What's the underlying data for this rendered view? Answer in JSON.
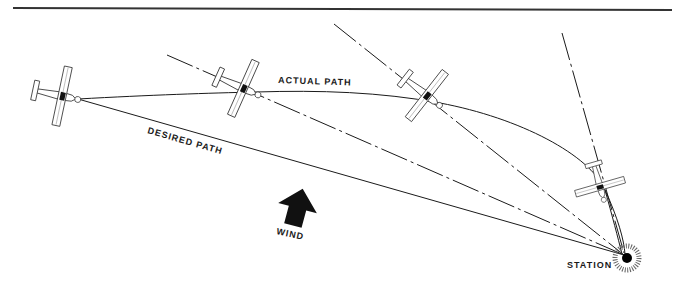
{
  "diagram": {
    "type": "wind-drift navigation diagram",
    "labels": {
      "actual_path": "ACTUAL PATH",
      "desired_path": "DESIRED PATH",
      "wind": "WIND",
      "station": "STATION"
    },
    "colors": {
      "ink": "#1a1a1a",
      "background": "#ffffff"
    },
    "elements": {
      "airplanes": [
        {
          "position": "start",
          "heading": "toward station along desired path"
        },
        {
          "position": "second",
          "heading": "toward station"
        },
        {
          "position": "third",
          "heading": "toward station"
        },
        {
          "position": "fourth",
          "heading": "toward station, near arrival"
        }
      ],
      "lines": {
        "desired_path": "solid straight line from first airplane to station",
        "actual_path": "solid curved line through airplanes to station",
        "bearing_lines": "dash-dot lines from each airplane to station"
      }
    }
  }
}
